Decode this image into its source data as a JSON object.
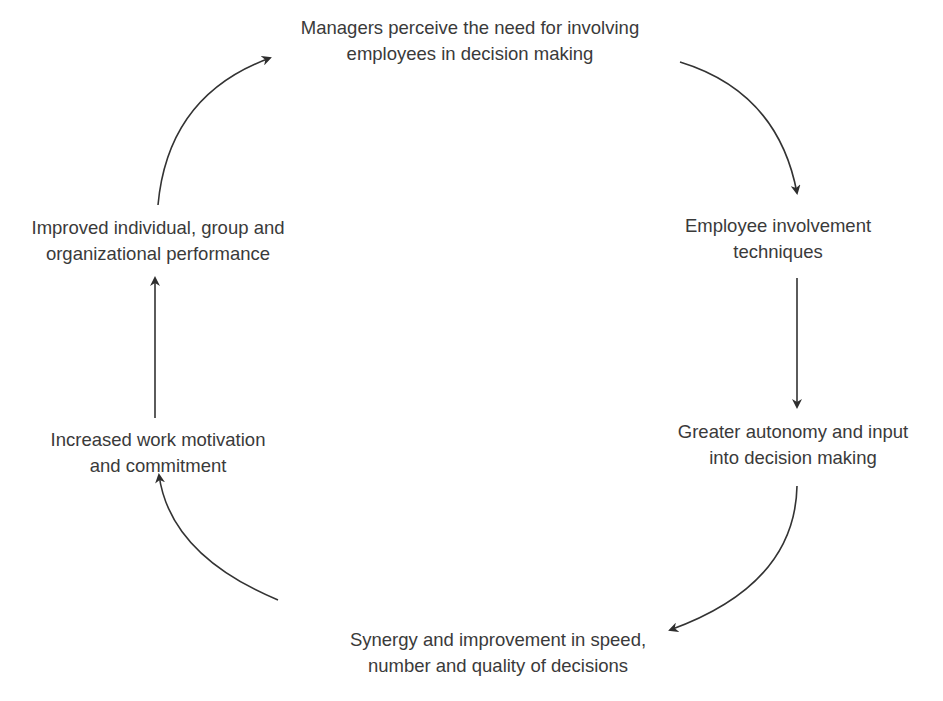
{
  "diagram": {
    "type": "cycle",
    "stroke_color": "#333333",
    "text_color": "#3a3a3a",
    "nodes": [
      {
        "id": "managers",
        "lines": [
          "Managers perceive the need for involving",
          "employees in decision making"
        ]
      },
      {
        "id": "techniques",
        "lines": [
          "Employee involvement",
          "techniques"
        ]
      },
      {
        "id": "autonomy",
        "lines": [
          "Greater autonomy and input",
          "into decision making"
        ]
      },
      {
        "id": "synergy",
        "lines": [
          "Synergy and improvement in speed,",
          "number and quality of decisions"
        ]
      },
      {
        "id": "motivation",
        "lines": [
          "Increased work motivation",
          "and commitment"
        ]
      },
      {
        "id": "performance",
        "lines": [
          "Improved individual, group and",
          "organizational performance"
        ]
      }
    ],
    "edges": [
      {
        "from": "managers",
        "to": "techniques"
      },
      {
        "from": "techniques",
        "to": "autonomy"
      },
      {
        "from": "autonomy",
        "to": "synergy"
      },
      {
        "from": "synergy",
        "to": "motivation"
      },
      {
        "from": "motivation",
        "to": "performance"
      },
      {
        "from": "performance",
        "to": "managers"
      }
    ]
  }
}
